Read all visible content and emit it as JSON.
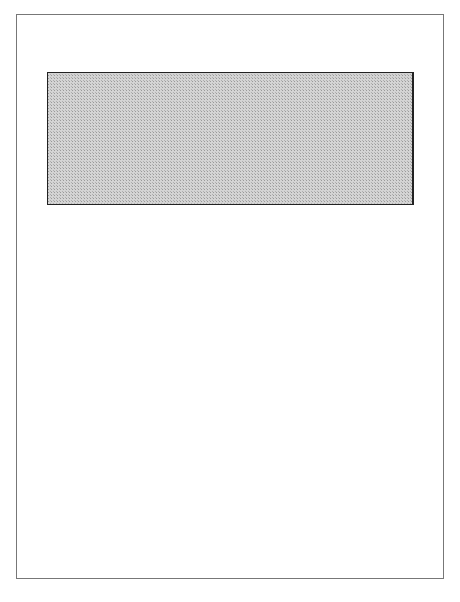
{
  "diagram": {
    "type": "flow-diagram",
    "external_inputs": [
      {
        "id": "it_strategy",
        "label": "I.T. Strategy"
      },
      {
        "id": "business_strategy",
        "label": "Business/marketing strategy"
      }
    ],
    "nodes": [
      {
        "id": "need",
        "lines": [
          "Need for",
          "change",
          "identified"
        ]
      },
      {
        "id": "org_obj",
        "lines": [
          "Organizational",
          "objectives"
        ]
      },
      {
        "id": "feas",
        "lines": [
          "Feasibility",
          "assessment"
        ]
      },
      {
        "id": "org_design",
        "lines": [
          "Organisational",
          "design"
        ]
      },
      {
        "id": "job",
        "lines": [
          "Job",
          "design"
        ]
      },
      {
        "id": "alloc",
        "lines": [
          "Allocation of",
          "function and",
          "requirements"
        ]
      },
      {
        "id": "personnel",
        "lines": [
          "Personnel",
          "policies"
        ]
      },
      {
        "id": "conceptual",
        "lines": [
          "Conceptual",
          "design"
        ]
      },
      {
        "id": "ui",
        "lines": [
          "User interface",
          "design"
        ]
      },
      {
        "id": "process",
        "lines": [
          "Process of",
          "change"
        ]
      },
      {
        "id": "system",
        "lines": [
          "System",
          "design"
        ]
      },
      {
        "id": "impl",
        "lines": [
          "Implementation",
          "and user",
          "support"
        ]
      },
      {
        "id": "network",
        "lines": [
          "Network",
          "design"
        ]
      },
      {
        "id": "proto",
        "lines": [
          "Prototype",
          " and",
          "evaluation"
        ]
      },
      {
        "id": "evaluation",
        "lines": [
          "Evaluation"
        ]
      },
      {
        "id": "database",
        "lines": [
          "Database",
          "design"
        ]
      },
      {
        "id": "evolution",
        "lines": [
          "Design for",
          "system",
          "evolution"
        ]
      }
    ],
    "colors": {
      "shaded_region": "#c8c8c8",
      "box_fill": "#ffffff",
      "line": "#222222"
    }
  }
}
